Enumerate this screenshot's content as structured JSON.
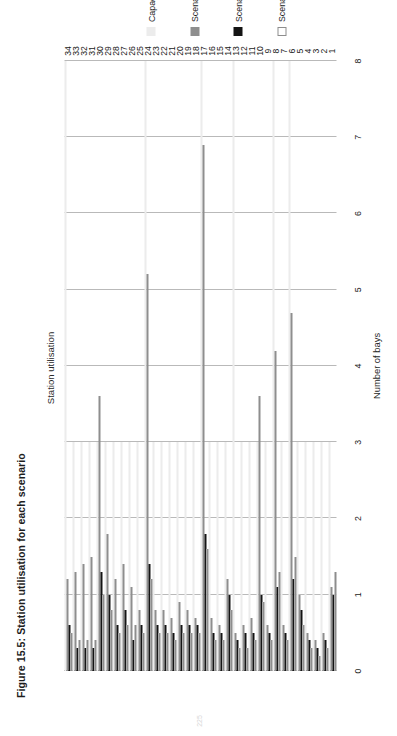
{
  "figure": {
    "caption": "Figure 15.5: Station utilisation for each scenario",
    "page_number": "225"
  },
  "chart_data": {
    "type": "bar",
    "orientation": "vertical",
    "title": "Station utilisation",
    "xlabel": "",
    "ylabel": "Number of bays",
    "ylim": [
      0,
      8
    ],
    "ytick_labels": [
      "0",
      "1",
      "2",
      "3",
      "4",
      "5",
      "6",
      "7",
      "8"
    ],
    "grid": true,
    "legend_position": "bottom",
    "categories": [
      "1",
      "2",
      "3",
      "4",
      "5",
      "6",
      "7",
      "8",
      "9",
      "10",
      "11",
      "12",
      "13",
      "14",
      "15",
      "16",
      "17",
      "18",
      "19",
      "20",
      "21",
      "22",
      "23",
      "24",
      "25",
      "26",
      "27",
      "28",
      "29",
      "30",
      "31",
      "32",
      "33",
      "34"
    ],
    "series": [
      {
        "name": "Capacity",
        "color": "#ececec",
        "values": [
          3,
          3,
          3,
          3,
          3,
          8,
          3,
          8,
          3,
          3,
          3,
          3,
          8,
          3,
          3,
          3,
          8,
          3,
          3,
          3,
          3,
          3,
          3,
          8,
          3,
          3,
          3,
          3,
          3,
          3,
          3,
          3,
          3,
          8
        ]
      },
      {
        "name": "Scenario 1",
        "color": "#8e8e8e",
        "values": [
          1.1,
          0.5,
          0.4,
          0.5,
          1.0,
          4.7,
          0.6,
          4.2,
          0.6,
          3.6,
          0.7,
          0.6,
          0.5,
          1.2,
          0.6,
          0.7,
          6.9,
          0.7,
          0.8,
          0.9,
          0.7,
          0.8,
          0.8,
          5.2,
          0.8,
          1.1,
          1.4,
          1.2,
          1.8,
          3.6,
          1.5,
          1.4,
          1.3,
          1.2
        ]
      },
      {
        "name": "Scenario 2",
        "color": "#141414",
        "values": [
          1.0,
          0.4,
          0.3,
          0.4,
          0.8,
          1.2,
          0.5,
          1.1,
          0.5,
          1.0,
          0.5,
          0.5,
          0.4,
          1.0,
          0.5,
          0.5,
          1.8,
          0.6,
          0.6,
          0.6,
          0.5,
          0.6,
          0.6,
          1.4,
          0.6,
          0.4,
          0.8,
          0.6,
          1.0,
          1.3,
          0.3,
          0.3,
          0.3,
          0.6
        ]
      },
      {
        "name": "Scenario 3",
        "color": "#ffffff",
        "values": [
          1.3,
          0.3,
          0.2,
          0.3,
          0.6,
          1.5,
          0.4,
          1.3,
          0.4,
          0.9,
          0.4,
          0.3,
          0.3,
          0.8,
          0.4,
          0.4,
          1.6,
          0.5,
          0.5,
          0.5,
          0.4,
          0.5,
          0.5,
          1.2,
          0.5,
          0.6,
          0.6,
          0.5,
          0.8,
          1.0,
          0.4,
          0.4,
          0.4,
          0.5
        ]
      }
    ]
  }
}
